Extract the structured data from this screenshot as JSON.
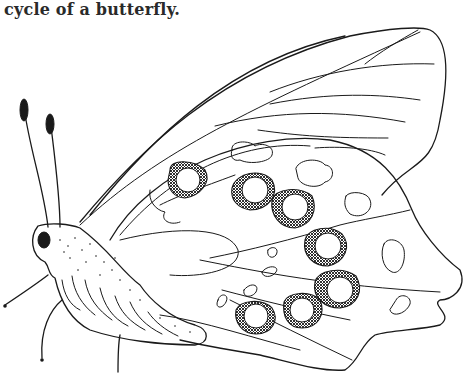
{
  "caption": {
    "text": "cycle of a butterfly."
  },
  "illustration": {
    "subject": "butterfly",
    "style": "black ink line drawing",
    "ink_color": "#1a1a1a",
    "background_color": "#ffffff"
  }
}
